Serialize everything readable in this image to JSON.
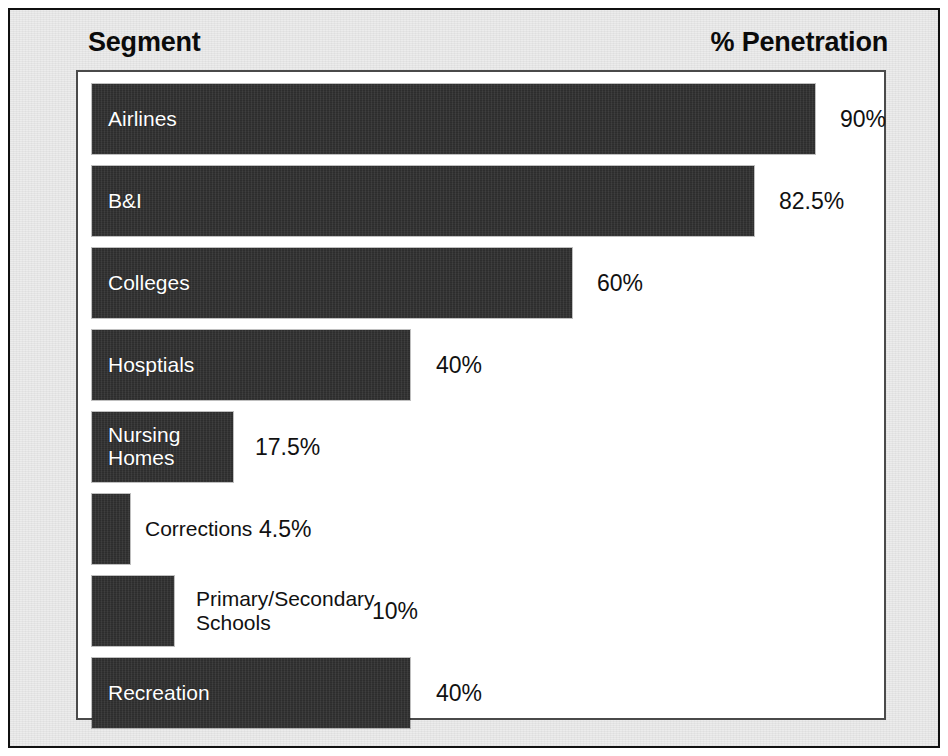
{
  "header": {
    "left_title": "Segment",
    "right_title": "% Penetration"
  },
  "colors": {
    "bar_fill": "#2d2d2d",
    "mat_background": "#ececec",
    "panel_background": "#ffffff",
    "frame_border": "#101010",
    "panel_border": "#4a4a4a",
    "inside_label_text": "#ffffff",
    "outside_label_text": "#111111"
  },
  "chart_data": {
    "type": "bar",
    "orientation": "horizontal",
    "title": "",
    "xlabel": "% Penetration",
    "ylabel": "Segment",
    "xlim": [
      0,
      100
    ],
    "grid": false,
    "legend": "none",
    "value_suffix": "%",
    "categories": [
      "Airlines",
      "B&I",
      "Colleges",
      "Hosptials",
      "Nursing Homes",
      "Corrections",
      "Primary/Secondary Schools",
      "Recreation"
    ],
    "values": [
      90,
      82.5,
      60,
      40,
      17.5,
      4.5,
      10,
      40
    ],
    "value_labels": [
      "90%",
      "82.5%",
      "60%",
      "40%",
      "17.5%",
      "4.5%",
      "10%",
      "40%"
    ],
    "bars": [
      {
        "category": "Airlines",
        "label": "Airlines",
        "value": 90,
        "value_label": "90%",
        "label_placement": "inside",
        "bar_width_px": 723,
        "label_left_px": 0,
        "value_left_px": 748
      },
      {
        "category": "B&I",
        "label": "B&I",
        "value": 82.5,
        "value_label": "82.5%",
        "label_placement": "inside",
        "bar_width_px": 662,
        "label_left_px": 0,
        "value_left_px": 687
      },
      {
        "category": "Colleges",
        "label": "Colleges",
        "value": 60,
        "value_label": "60%",
        "label_placement": "inside",
        "bar_width_px": 480,
        "label_left_px": 0,
        "value_left_px": 505
      },
      {
        "category": "Hosptials",
        "label": "Hosptials",
        "value": 40,
        "value_label": "40%",
        "label_placement": "inside",
        "bar_width_px": 318,
        "label_left_px": 0,
        "value_left_px": 344
      },
      {
        "category": "Nursing Homes",
        "label": "Nursing\nHomes",
        "value": 17.5,
        "value_label": "17.5%",
        "label_placement": "inside",
        "bar_width_px": 141,
        "label_left_px": 0,
        "value_left_px": 163
      },
      {
        "category": "Corrections",
        "label": "Corrections",
        "value": 4.5,
        "value_label": "4.5%",
        "label_placement": "outside",
        "bar_width_px": 38,
        "label_left_px": 53,
        "value_left_px": 167
      },
      {
        "category": "Primary/Secondary Schools",
        "label": "Primary/Secondary\nSchools",
        "value": 10,
        "value_label": "10%",
        "label_placement": "outside",
        "bar_width_px": 82,
        "label_left_px": 104,
        "value_left_px": 280
      },
      {
        "category": "Recreation",
        "label": "Recreation",
        "value": 40,
        "value_label": "40%",
        "label_placement": "inside",
        "bar_width_px": 318,
        "label_left_px": 0,
        "value_left_px": 344
      }
    ]
  }
}
